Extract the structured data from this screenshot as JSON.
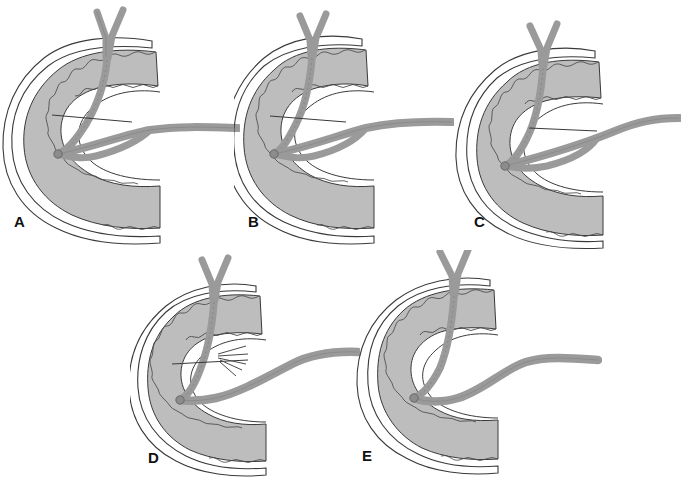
{
  "figure": {
    "panel_count": 5,
    "background_color": "#ffffff",
    "colors": {
      "duodenal_wall_fill": "#bdbdbd",
      "vessel_fill": "#9a9a9a",
      "vessel_dark": "#8c8c8c",
      "outline": "#3a3a3a",
      "mucosa_highlight": "#ffffff",
      "label_color": "#111111"
    },
    "panels": [
      {
        "id": "panel-a",
        "letter": "A",
        "label_x": 14,
        "label_y": 222,
        "origin_x": 0,
        "origin_y": 0,
        "variant": "branched-graft-two-limbs",
        "has_y_vessel": true,
        "has_branch_tuft": false,
        "graft_limbs": 2,
        "suture_line": true
      },
      {
        "id": "panel-b",
        "letter": "B",
        "label_x": 248,
        "label_y": 222,
        "origin_x": 234,
        "origin_y": 0,
        "variant": "branched-graft-two-limbs",
        "has_y_vessel": true,
        "has_branch_tuft": false,
        "graft_limbs": 2,
        "suture_line": true
      },
      {
        "id": "panel-c",
        "letter": "C",
        "label_x": 474,
        "label_y": 222,
        "origin_x": 447,
        "origin_y": 0,
        "variant": "branched-graft-two-limbs",
        "has_y_vessel": true,
        "has_branch_tuft": false,
        "graft_limbs": 2,
        "suture_line": true
      },
      {
        "id": "panel-d",
        "letter": "D",
        "label_x": 148,
        "label_y": 458,
        "origin_x": 130,
        "origin_y": 250,
        "variant": "single-graft-with-branch-tuft",
        "has_y_vessel": true,
        "has_branch_tuft": true,
        "graft_limbs": 1,
        "suture_line": true
      },
      {
        "id": "panel-e",
        "letter": "E",
        "label_x": 362,
        "label_y": 458,
        "origin_x": 342,
        "origin_y": 250,
        "variant": "single-smooth-graft",
        "has_y_vessel": true,
        "has_branch_tuft": false,
        "graft_limbs": 1,
        "suture_line": false
      }
    ],
    "footer_fragment": ""
  }
}
